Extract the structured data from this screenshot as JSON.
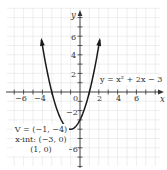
{
  "chart_data": {
    "type": "line",
    "title": "",
    "xlabel": "x",
    "ylabel": "y",
    "xlim": [
      -7.5,
      8.5
    ],
    "ylim": [
      -7.8,
      9
    ],
    "grid": true,
    "x_ticks": [
      -6,
      -4,
      2,
      4,
      6
    ],
    "x_tick_labels": [
      "−6",
      "−4",
      "2",
      "4",
      "6"
    ],
    "y_ticks": [
      6,
      4,
      2,
      -2,
      -6
    ],
    "y_tick_labels": [
      "6",
      "4",
      "2",
      "−2",
      "−6"
    ],
    "origin_label": "0",
    "series": [
      {
        "name": "y = x² + 2x − 3",
        "function": "x^2 + 2x - 3",
        "x": [
          -4.1,
          -4,
          -3.5,
          -3,
          -2.5,
          -2,
          -1.5,
          -1,
          -0.5,
          0,
          0.5,
          1,
          1.5,
          2,
          2.1
        ],
        "y": [
          5.61,
          5,
          2.25,
          0,
          -1.75,
          -3,
          -3.75,
          -4,
          -3.75,
          -3,
          -1.75,
          0,
          2.25,
          5,
          5.61
        ],
        "arrows": "both-ends"
      }
    ],
    "annotations": [
      {
        "label": "equation",
        "text": "y = x² + 2x − 3"
      },
      {
        "label": "vertex",
        "text": "V = (−1, −4)"
      },
      {
        "label": "x-intercepts",
        "text": "x-int: (−3, 0)"
      },
      {
        "label": "x-intercept-2",
        "text": "(1, 0)"
      }
    ]
  },
  "labels": {
    "x_axis": "x",
    "y_axis": "y",
    "origin": "0",
    "equation": "y = x² + 2x − 3",
    "vertex": "V = (−1, −4)",
    "xint1": "x-int: (−3, 0)",
    "xint2": "(1, 0)",
    "xt": [
      "−6",
      "−4",
      "2",
      "4",
      "6"
    ],
    "yt": [
      "6",
      "4",
      "2",
      "−2",
      "−6"
    ]
  }
}
